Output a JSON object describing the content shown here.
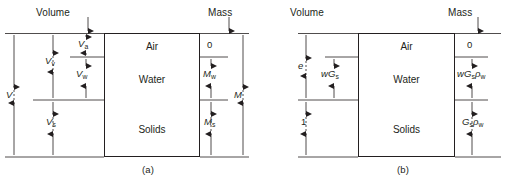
{
  "figure": {
    "background_color": "#ffffff",
    "line_color": "#231f20"
  },
  "panels": [
    {
      "id": "a",
      "caption": "(a)",
      "headers": {
        "left": "Volume",
        "right": "Mass"
      },
      "phases": [
        {
          "name": "Air",
          "label": "Air"
        },
        {
          "name": "Water",
          "label": "Water"
        },
        {
          "name": "Solids",
          "label": "Solids"
        }
      ],
      "volume_labels": {
        "total": "V",
        "voids": "V",
        "voids_sub": "v",
        "air": "V",
        "air_sub": "a",
        "water": "V",
        "water_sub": "w",
        "solids": "V",
        "solids_sub": "s"
      },
      "mass_labels": {
        "air": "0",
        "water": "M",
        "water_sub": "w",
        "solids": "M",
        "solids_sub": "s",
        "total": "M"
      }
    },
    {
      "id": "b",
      "caption": "(b)",
      "headers": {
        "left": "Volume",
        "right": "Mass"
      },
      "phases": [
        {
          "name": "Air",
          "label": "Air"
        },
        {
          "name": "Water",
          "label": "Water"
        },
        {
          "name": "Solids",
          "label": "Solids"
        }
      ],
      "volume_labels": {
        "voids": "e",
        "water": "wG",
        "water_sub": "s",
        "solids": "1"
      },
      "mass_labels": {
        "air": "0",
        "water_pre": "wG",
        "water_sub1": "s",
        "water_rho": "ρ",
        "water_sub2": "w",
        "solids_pre": "G",
        "solids_sub1": "s",
        "solids_rho": "ρ",
        "solids_sub2": "w"
      }
    }
  ]
}
